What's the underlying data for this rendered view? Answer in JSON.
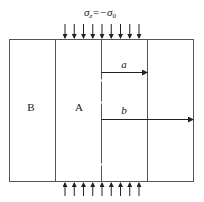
{
  "diagram": {
    "load_label_main": "σ",
    "load_label_sub": "z",
    "load_label_rest": "=−σ",
    "load_label_sub2": "0",
    "region_outer": "B",
    "region_inner": "A",
    "radius_inner": "a",
    "radius_outer": "b",
    "arrow_count_top": 9,
    "arrow_count_bottom": 9
  }
}
